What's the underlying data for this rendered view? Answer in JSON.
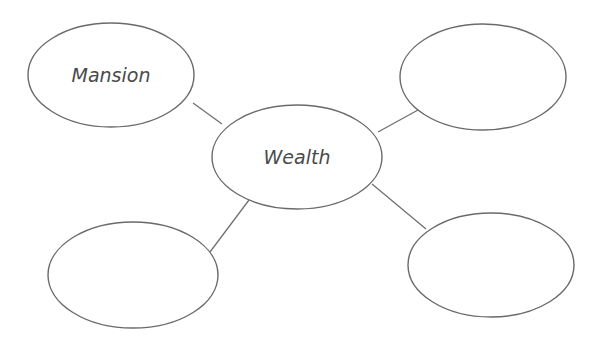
{
  "diagram": {
    "type": "bubble-map",
    "center": {
      "label": "Wealth",
      "cx": 297,
      "cy": 157,
      "rx": 85,
      "ry": 52
    },
    "nodes": [
      {
        "id": "top-left",
        "label": "Mansion",
        "cx": 111,
        "cy": 75,
        "rx": 83,
        "ry": 52
      },
      {
        "id": "top-right",
        "label": "",
        "cx": 483,
        "cy": 77,
        "rx": 83,
        "ry": 53
      },
      {
        "id": "bottom-left",
        "label": "",
        "cx": 133,
        "cy": 275,
        "rx": 85,
        "ry": 53
      },
      {
        "id": "bottom-right",
        "label": "",
        "cx": 491,
        "cy": 265,
        "rx": 83,
        "ry": 52
      }
    ],
    "connectors": [
      {
        "from": "top-left",
        "to": "center",
        "x1": 193,
        "y1": 103,
        "x2": 222,
        "y2": 124
      },
      {
        "from": "top-right",
        "to": "center",
        "x1": 418,
        "y1": 110,
        "x2": 378,
        "y2": 132
      },
      {
        "from": "bottom-left",
        "to": "center",
        "x1": 210,
        "y1": 252,
        "x2": 249,
        "y2": 200
      },
      {
        "from": "bottom-right",
        "to": "center",
        "x1": 426,
        "y1": 229,
        "x2": 372,
        "y2": 184
      }
    ],
    "colors": {
      "stroke": "#6a6a6a",
      "text": "#4a4a4a",
      "background": "#ffffff"
    }
  }
}
